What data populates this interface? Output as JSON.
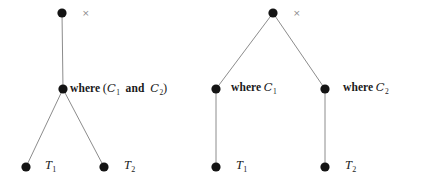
{
  "figure": {
    "title": "",
    "background_color": "#ffffff",
    "node_color": "#141414",
    "edge_color": "#8c8c8c",
    "text_color": "#1a1a1a",
    "times_mark_color": "#8a8a8a",
    "width": 431,
    "height": 186
  },
  "trees": [
    {
      "id": "left-tree",
      "name": "combined-where-tree",
      "root": {
        "id": "left-root",
        "x": 62,
        "y": 13,
        "r": 4.6,
        "times_mark": {
          "glyph": "×",
          "x": 82,
          "y": 9
        }
      },
      "nodes": [
        {
          "id": "left-where",
          "x": 63,
          "y": 89,
          "r": 4.6,
          "label": {
            "text": "where (C1 and C2)",
            "prefix": "where",
            "open_paren": "(",
            "operand_1": "C",
            "operand_1_sub": "1",
            "conjunction": "and",
            "operand_2": "C",
            "operand_2_sub": "2",
            "close_paren": ")",
            "x": 70,
            "y": 82
          }
        },
        {
          "id": "left-leaf-1",
          "x": 26,
          "y": 167,
          "r": 4.6,
          "label": {
            "text": "T1",
            "base": "T",
            "sub": "1",
            "x": 45,
            "y": 159
          }
        },
        {
          "id": "left-leaf-2",
          "x": 104,
          "y": 167,
          "r": 4.6,
          "label": {
            "text": "T2",
            "base": "T",
            "sub": "2",
            "x": 124,
            "y": 159
          }
        }
      ],
      "edges": [
        {
          "id": "left-edge-root-where",
          "from": "left-root",
          "to": "left-where",
          "x1": 62,
          "y1": 13,
          "x2": 63,
          "y2": 89
        },
        {
          "id": "left-edge-where-leaf1",
          "from": "left-where",
          "to": "left-leaf-1",
          "x1": 63,
          "y1": 89,
          "x2": 26,
          "y2": 167
        },
        {
          "id": "left-edge-where-leaf2",
          "from": "left-where",
          "to": "left-leaf-2",
          "x1": 63,
          "y1": 89,
          "x2": 104,
          "y2": 167
        }
      ]
    },
    {
      "id": "right-tree",
      "name": "split-where-tree",
      "root": {
        "id": "right-root",
        "x": 273,
        "y": 13,
        "r": 4.6,
        "times_mark": {
          "glyph": "×",
          "x": 293,
          "y": 9
        }
      },
      "nodes": [
        {
          "id": "right-where-1",
          "x": 216,
          "y": 89,
          "r": 4.6,
          "label": {
            "text": "where C1",
            "prefix": "where",
            "operand": "C",
            "operand_sub": "1",
            "x": 231,
            "y": 82
          }
        },
        {
          "id": "right-where-2",
          "x": 325,
          "y": 89,
          "r": 4.6,
          "label": {
            "text": "where C2",
            "prefix": "where",
            "operand": "C",
            "operand_sub": "2",
            "x": 343,
            "y": 82
          }
        },
        {
          "id": "right-leaf-1",
          "x": 216,
          "y": 167,
          "r": 4.6,
          "label": {
            "text": "T1",
            "base": "T",
            "sub": "1",
            "x": 236,
            "y": 159
          }
        },
        {
          "id": "right-leaf-2",
          "x": 325,
          "y": 167,
          "r": 4.6,
          "label": {
            "text": "T2",
            "base": "T",
            "sub": "2",
            "x": 345,
            "y": 159
          }
        }
      ],
      "edges": [
        {
          "id": "right-edge-root-where1",
          "from": "right-root",
          "to": "right-where-1",
          "x1": 273,
          "y1": 13,
          "x2": 216,
          "y2": 89
        },
        {
          "id": "right-edge-root-where2",
          "from": "right-root",
          "to": "right-where-2",
          "x1": 273,
          "y1": 13,
          "x2": 325,
          "y2": 89
        },
        {
          "id": "right-edge-where1-leaf1",
          "from": "right-where-1",
          "to": "right-leaf-1",
          "x1": 216,
          "y1": 89,
          "x2": 216,
          "y2": 167
        },
        {
          "id": "right-edge-where2-leaf2",
          "from": "right-where-2",
          "to": "right-leaf-2",
          "x1": 325,
          "y1": 89,
          "x2": 325,
          "y2": 167
        }
      ]
    }
  ]
}
